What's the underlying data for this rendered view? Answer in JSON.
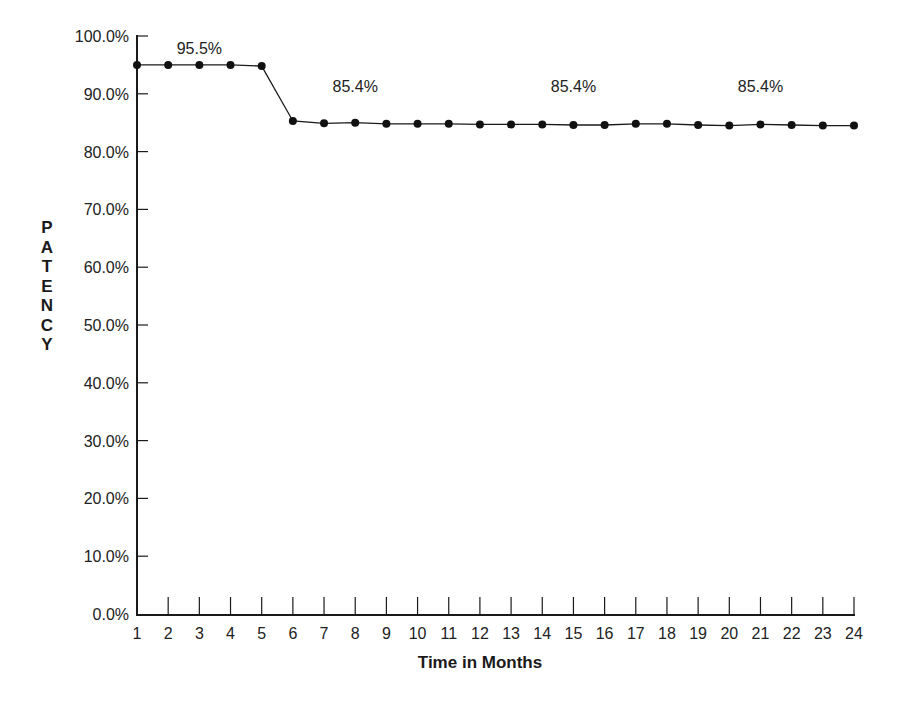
{
  "chart_data": {
    "type": "line",
    "title": "",
    "xlabel": "Time in Months",
    "ylabel": "PATENCY",
    "x": [
      1,
      2,
      3,
      4,
      5,
      6,
      7,
      8,
      9,
      10,
      11,
      12,
      13,
      14,
      15,
      16,
      17,
      18,
      19,
      20,
      21,
      22,
      23,
      24
    ],
    "series": [
      {
        "name": "Patency",
        "values": [
          95.0,
          95.0,
          95.0,
          95.0,
          94.8,
          85.3,
          84.9,
          85.0,
          84.8,
          84.8,
          84.8,
          84.7,
          84.7,
          84.7,
          84.6,
          84.6,
          84.8,
          84.8,
          84.6,
          84.5,
          84.7,
          84.6,
          84.5,
          84.5
        ]
      }
    ],
    "annotations": [
      {
        "text": "95.5%",
        "x": 3,
        "y": 97.5
      },
      {
        "text": "85.4%",
        "x": 8,
        "y": 91.0
      },
      {
        "text": "85.4%",
        "x": 15,
        "y": 91.0
      },
      {
        "text": "85.4%",
        "x": 21,
        "y": 91.0
      }
    ],
    "yticks": [
      "0.0%",
      "10.0%",
      "20.0%",
      "30.0%",
      "40.0%",
      "50.0%",
      "60.0%",
      "70.0%",
      "80.0%",
      "90.0%",
      "100.0%"
    ],
    "xticks": [
      "1",
      "2",
      "3",
      "4",
      "5",
      "6",
      "7",
      "8",
      "9",
      "10",
      "11",
      "12",
      "13",
      "14",
      "15",
      "16",
      "17",
      "18",
      "19",
      "20",
      "21",
      "22",
      "23",
      "24"
    ],
    "ylim": [
      0,
      100
    ],
    "xlim": [
      1,
      24
    ],
    "grid": false,
    "legend": "none",
    "colors": {
      "line": "#1a1a1a",
      "marker": "#111111",
      "axis": "#1a1a1a",
      "text": "#222222"
    }
  }
}
